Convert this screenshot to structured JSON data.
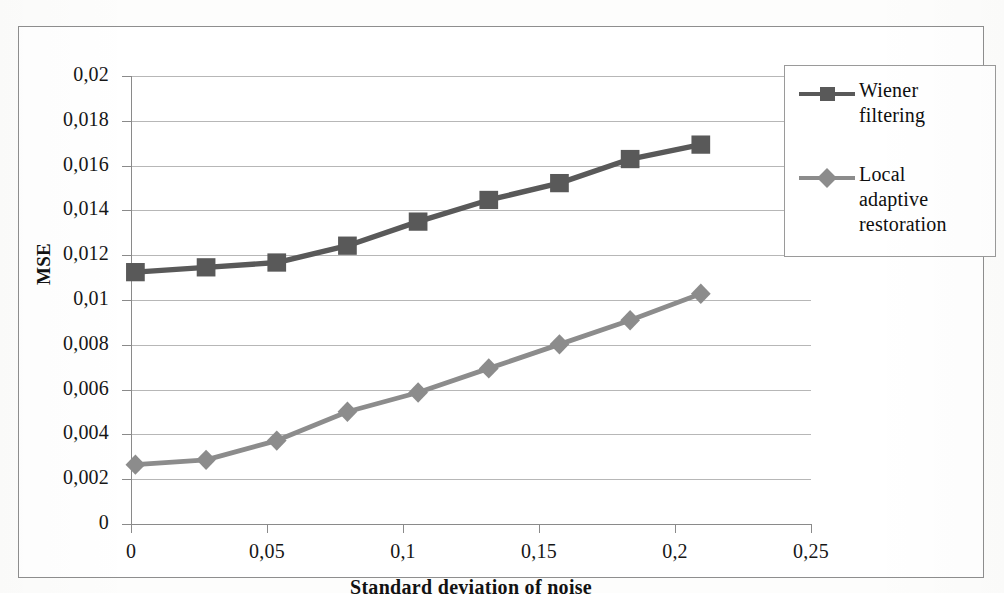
{
  "chart_data": {
    "type": "line",
    "title": "",
    "xlabel": "Standard deviation of noise",
    "ylabel": "MSE",
    "x": [
      0,
      0.025,
      0.05,
      0.075,
      0.1,
      0.125,
      0.15,
      0.175,
      0.2
    ],
    "xlim": [
      0,
      0.25
    ],
    "ylim": [
      0,
      0.02
    ],
    "xticks": [
      0,
      0.05,
      0.1,
      0.15,
      0.2,
      0.25
    ],
    "xtick_labels": [
      "0",
      "0,05",
      "0,1",
      "0,15",
      "0,2",
      "0,25"
    ],
    "yticks": [
      0,
      0.002,
      0.004,
      0.006,
      0.008,
      0.01,
      0.012,
      0.014,
      0.016,
      0.018,
      0.02
    ],
    "ytick_labels": [
      "0",
      "0,002",
      "0,004",
      "0,006",
      "0,008",
      "0,01",
      "0,012",
      "0,014",
      "0,016",
      "0,018",
      "0,02"
    ],
    "grid": true,
    "legend_position": "right-top",
    "series": [
      {
        "name": "Wiener filtering",
        "marker": "square",
        "color": "#595959",
        "values": [
          0.012,
          0.0122,
          0.0124,
          0.0131,
          0.0141,
          0.015,
          0.0157,
          0.0167,
          0.0173
        ]
      },
      {
        "name": "Local adaptive restoration",
        "marker": "diamond",
        "color": "#8c8c8c",
        "values": [
          0.004,
          0.0042,
          0.005,
          0.0062,
          0.007,
          0.008,
          0.009,
          0.01,
          0.0111
        ]
      }
    ]
  },
  "axes": {
    "x_title": "Standard deviation of noise",
    "y_title": "MSE"
  },
  "legend": {
    "items": [
      {
        "label": "Wiener\nfiltering",
        "color": "#595959",
        "marker": "square"
      },
      {
        "label": "Local\nadaptive\nrestoration",
        "color": "#8c8c8c",
        "marker": "diamond"
      }
    ]
  },
  "colors": {
    "series_wiener": "#595959",
    "series_local": "#8c8c8c",
    "gridline": "#b7b7b7",
    "axis": "#8a8a8a",
    "frame": "#8e8e8e",
    "text": "#161616",
    "background": "#ffffff"
  }
}
